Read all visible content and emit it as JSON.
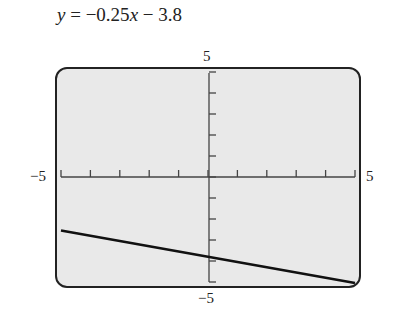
{
  "equation": {
    "y": "y",
    "rest": " = −0.25",
    "x": "x",
    "tail": " − 3.8"
  },
  "axis_labels": {
    "ymax": "5",
    "ymin": "−5",
    "xmin": "−5",
    "xmax": "5"
  },
  "chart_data": {
    "type": "line",
    "title": "y = −0.25x − 3.8",
    "xlabel": "",
    "ylabel": "",
    "xlim": [
      -5,
      5
    ],
    "ylim": [
      -5,
      5
    ],
    "xticks_step": 1,
    "yticks_step": 1,
    "grid": false,
    "series": [
      {
        "name": "y = -0.25x - 3.8",
        "slope": -0.25,
        "intercept": -3.8,
        "x": [
          -5,
          -4,
          -3,
          -2,
          -1,
          0,
          1,
          2,
          3,
          4,
          5
        ],
        "values": [
          -2.55,
          -2.8,
          -3.05,
          -3.3,
          -3.55,
          -3.8,
          -4.05,
          -4.3,
          -4.55,
          -4.8,
          -5.05
        ]
      }
    ],
    "colors": {
      "screen": "#e9e9e9",
      "line": "#111111",
      "frame": "#222222"
    }
  }
}
